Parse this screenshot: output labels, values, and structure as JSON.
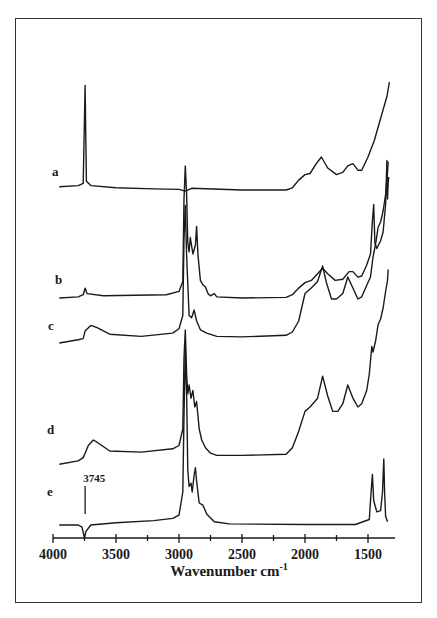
{
  "chart_data": {
    "type": "line",
    "title": "",
    "xlabel": "Wavenumber cm",
    "xlabel_sup": "-1",
    "ylabel": "",
    "xlim": [
      4000,
      1285
    ],
    "x_reversed": true,
    "xticks": [
      4000,
      3500,
      3000,
      2500,
      2000,
      1500
    ],
    "xtick_labels": [
      "4000",
      "3500",
      "3000",
      "2500",
      "2000",
      "1500"
    ],
    "minor_tick_step": 250,
    "grid": false,
    "legend": "none",
    "stacked_offset_spectra": true,
    "annotations": [
      {
        "text": "3745",
        "x": 3745,
        "target_series": "e"
      }
    ],
    "series": [
      {
        "name": "a",
        "offset": 4,
        "points": [
          [
            3950,
            0.3
          ],
          [
            3800,
            0.4
          ],
          [
            3760,
            0.6
          ],
          [
            3745,
            9.5
          ],
          [
            3735,
            0.8
          ],
          [
            3700,
            0.4
          ],
          [
            3500,
            0.2
          ],
          [
            3200,
            0.1
          ],
          [
            3000,
            0.05
          ],
          [
            2950,
            -0.1
          ],
          [
            2900,
            0.15
          ],
          [
            2500,
            0
          ],
          [
            2150,
            0
          ],
          [
            2100,
            0.2
          ],
          [
            2050,
            0.9
          ],
          [
            2000,
            1.4
          ],
          [
            1960,
            1.5
          ],
          [
            1910,
            2.4
          ],
          [
            1870,
            3.0
          ],
          [
            1820,
            2.0
          ],
          [
            1750,
            1.4
          ],
          [
            1700,
            1.6
          ],
          [
            1660,
            2.2
          ],
          [
            1620,
            2.4
          ],
          [
            1580,
            1.8
          ],
          [
            1550,
            1.8
          ],
          [
            1500,
            3.0
          ],
          [
            1450,
            4.5
          ],
          [
            1400,
            6.5
          ],
          [
            1350,
            8.5
          ],
          [
            1330,
            9.8
          ]
        ]
      },
      {
        "name": "b",
        "offset": 2.5,
        "points": [
          [
            3950,
            0
          ],
          [
            3800,
            0.1
          ],
          [
            3760,
            0.3
          ],
          [
            3745,
            0.9
          ],
          [
            3730,
            0.4
          ],
          [
            3600,
            0.2
          ],
          [
            3100,
            0.3
          ],
          [
            3000,
            0.6
          ],
          [
            2970,
            1.5
          ],
          [
            2960,
            9.0
          ],
          [
            2950,
            12.0
          ],
          [
            2940,
            9.5
          ],
          [
            2930,
            5.0
          ],
          [
            2920,
            4.2
          ],
          [
            2910,
            5.5
          ],
          [
            2890,
            4.0
          ],
          [
            2870,
            4.8
          ],
          [
            2860,
            6.5
          ],
          [
            2850,
            4.0
          ],
          [
            2830,
            1.6
          ],
          [
            2810,
            1.2
          ],
          [
            2790,
            1.0
          ],
          [
            2770,
            0.4
          ],
          [
            2750,
            0.2
          ],
          [
            2720,
            0.4
          ],
          [
            2700,
            0.1
          ],
          [
            2500,
            0
          ],
          [
            2150,
            0.05
          ],
          [
            2100,
            0.3
          ],
          [
            2050,
            0.9
          ],
          [
            2000,
            1.4
          ],
          [
            1950,
            1.6
          ],
          [
            1900,
            2.2
          ],
          [
            1860,
            2.7
          ],
          [
            1820,
            2.2
          ],
          [
            1760,
            1.6
          ],
          [
            1700,
            1.7
          ],
          [
            1650,
            2.4
          ],
          [
            1620,
            2.4
          ],
          [
            1580,
            1.9
          ],
          [
            1550,
            2.0
          ],
          [
            1510,
            3.0
          ],
          [
            1480,
            4.0
          ],
          [
            1465,
            7.0
          ],
          [
            1455,
            8.5
          ],
          [
            1445,
            5.0
          ],
          [
            1430,
            4.5
          ],
          [
            1400,
            5.2
          ],
          [
            1380,
            6.0
          ],
          [
            1360,
            8.5
          ],
          [
            1350,
            12.5
          ],
          [
            1345,
            9.0
          ],
          [
            1340,
            10.5
          ],
          [
            1335,
            11.0
          ]
        ]
      },
      {
        "name": "c",
        "offset": 1.5,
        "points": [
          [
            3950,
            0
          ],
          [
            3800,
            0.3
          ],
          [
            3760,
            0.4
          ],
          [
            3745,
            1.1
          ],
          [
            3700,
            1.6
          ],
          [
            3650,
            1.4
          ],
          [
            3550,
            0.8
          ],
          [
            3300,
            0.6
          ],
          [
            3050,
            0.9
          ],
          [
            3000,
            1.3
          ],
          [
            2970,
            2.5
          ],
          [
            2960,
            9.5
          ],
          [
            2950,
            12.5
          ],
          [
            2940,
            8.0
          ],
          [
            2920,
            2.5
          ],
          [
            2900,
            2.3
          ],
          [
            2880,
            3.0
          ],
          [
            2860,
            2.0
          ],
          [
            2830,
            1.2
          ],
          [
            2780,
            0.9
          ],
          [
            2700,
            0.6
          ],
          [
            2500,
            0.55
          ],
          [
            2150,
            0.7
          ],
          [
            2100,
            1.0
          ],
          [
            2050,
            2.0
          ],
          [
            2000,
            4.5
          ],
          [
            1950,
            5.0
          ],
          [
            1900,
            5.6
          ],
          [
            1860,
            7.0
          ],
          [
            1830,
            5.5
          ],
          [
            1790,
            4.0
          ],
          [
            1750,
            4.0
          ],
          [
            1700,
            4.5
          ],
          [
            1660,
            6.0
          ],
          [
            1620,
            5.0
          ],
          [
            1580,
            4.0
          ],
          [
            1550,
            4.2
          ],
          [
            1500,
            5.5
          ],
          [
            1480,
            6.0
          ],
          [
            1460,
            7.8
          ],
          [
            1440,
            9.0
          ],
          [
            1420,
            10.5
          ],
          [
            1400,
            11.0
          ],
          [
            1380,
            12.0
          ],
          [
            1360,
            13.5
          ],
          [
            1345,
            15.5
          ],
          [
            1340,
            16.5
          ]
        ]
      },
      {
        "name": "d",
        "offset": 1.0,
        "points": [
          [
            3950,
            -0.2
          ],
          [
            3800,
            0.1
          ],
          [
            3760,
            0.4
          ],
          [
            3745,
            0.8
          ],
          [
            3720,
            1.5
          ],
          [
            3680,
            2.0
          ],
          [
            3650,
            1.8
          ],
          [
            3550,
            1.0
          ],
          [
            3300,
            0.9
          ],
          [
            3050,
            1.2
          ],
          [
            3000,
            1.5
          ],
          [
            2970,
            3.0
          ],
          [
            2960,
            9.5
          ],
          [
            2950,
            12.0
          ],
          [
            2940,
            8.0
          ],
          [
            2930,
            6.2
          ],
          [
            2920,
            7.0
          ],
          [
            2905,
            5.8
          ],
          [
            2890,
            6.5
          ],
          [
            2875,
            5.0
          ],
          [
            2860,
            5.5
          ],
          [
            2840,
            3.0
          ],
          [
            2820,
            2.0
          ],
          [
            2790,
            1.3
          ],
          [
            2750,
            0.8
          ],
          [
            2700,
            0.6
          ],
          [
            2500,
            0.6
          ],
          [
            2150,
            0.7
          ],
          [
            2100,
            1.3
          ],
          [
            2050,
            2.8
          ],
          [
            2000,
            4.6
          ],
          [
            1960,
            5.0
          ],
          [
            1900,
            5.8
          ],
          [
            1860,
            7.8
          ],
          [
            1820,
            6.0
          ],
          [
            1780,
            4.6
          ],
          [
            1740,
            4.6
          ],
          [
            1700,
            5.3
          ],
          [
            1660,
            7.0
          ],
          [
            1620,
            5.8
          ],
          [
            1580,
            5.0
          ],
          [
            1550,
            5.3
          ],
          [
            1510,
            6.5
          ],
          [
            1490,
            8.0
          ],
          [
            1470,
            10.5
          ],
          [
            1460,
            10.0
          ],
          [
            1440,
            11.0
          ],
          [
            1420,
            12.5
          ],
          [
            1400,
            13.0
          ],
          [
            1380,
            14.0
          ],
          [
            1360,
            15.5
          ],
          [
            1345,
            16.5
          ],
          [
            1340,
            17.5
          ]
        ]
      },
      {
        "name": "e",
        "offset": 0,
        "points": [
          [
            3950,
            0
          ],
          [
            3800,
            0
          ],
          [
            3770,
            -0.2
          ],
          [
            3750,
            -1.2
          ],
          [
            3740,
            -0.6
          ],
          [
            3700,
            0
          ],
          [
            3500,
            0.2
          ],
          [
            3200,
            0.4
          ],
          [
            3050,
            0.6
          ],
          [
            3000,
            0.9
          ],
          [
            2970,
            3.0
          ],
          [
            2960,
            10.0
          ],
          [
            2950,
            16.0
          ],
          [
            2940,
            12.0
          ],
          [
            2930,
            5.0
          ],
          [
            2920,
            3.5
          ],
          [
            2905,
            3.8
          ],
          [
            2895,
            3.0
          ],
          [
            2880,
            4.5
          ],
          [
            2870,
            5.2
          ],
          [
            2860,
            4.0
          ],
          [
            2840,
            2.0
          ],
          [
            2810,
            1.8
          ],
          [
            2780,
            1.0
          ],
          [
            2720,
            0.3
          ],
          [
            2600,
            0.1
          ],
          [
            2000,
            0.05
          ],
          [
            1600,
            0.05
          ],
          [
            1490,
            0.5
          ],
          [
            1475,
            3.0
          ],
          [
            1465,
            4.6
          ],
          [
            1455,
            2.2
          ],
          [
            1430,
            1.2
          ],
          [
            1400,
            1.3
          ],
          [
            1385,
            3.0
          ],
          [
            1375,
            6.0
          ],
          [
            1368,
            3.0
          ],
          [
            1360,
            0.8
          ],
          [
            1345,
            0.3
          ]
        ]
      }
    ]
  }
}
